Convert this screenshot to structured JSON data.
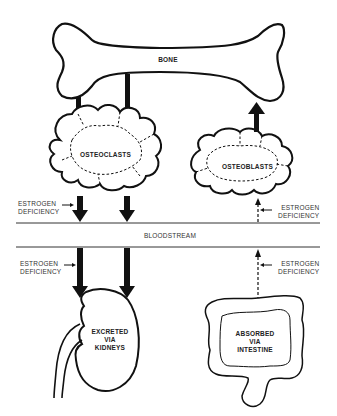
{
  "diagram": {
    "type": "osteoporosis calcium flow schematic",
    "nodes": {
      "bone": "BONE",
      "osteoclasts": "OSTEOCLASTS",
      "osteoblasts": "OSTEOBLASTS",
      "bloodstream": "BLOODSTREAM",
      "kidneys": [
        "EXCRETED",
        "VIA",
        "KIDNEYS"
      ],
      "intestine": [
        "ABSORBED",
        "VIA",
        "INTESTINE"
      ]
    },
    "annotations": {
      "estrogen_deficiency_left_upper": [
        "ESTROGEN",
        "DEFICIENCY"
      ],
      "estrogen_deficiency_right_upper": [
        "ESTROGEN",
        "DEFICIENCY"
      ],
      "estrogen_deficiency_left_lower": [
        "ESTROGEN",
        "DEFICIENCY"
      ],
      "estrogen_deficiency_right_lower": [
        "ESTROGEN",
        "DEFICIENCY"
      ]
    },
    "edges": [
      {
        "from": "BONE",
        "to": "OSTEOCLASTS",
        "style": "thick solid",
        "count": 2
      },
      {
        "from": "OSTEOCLASTS",
        "to": "BLOODSTREAM",
        "style": "thick solid arrow (increased)",
        "count": 2
      },
      {
        "from": "BLOODSTREAM",
        "to": "KIDNEYS",
        "style": "thick solid arrow (increased)",
        "count": 2
      },
      {
        "from": "OSTEOBLASTS",
        "to": "BONE",
        "style": "thick solid arrow"
      },
      {
        "from": "BLOODSTREAM",
        "to": "OSTEOBLASTS",
        "style": "dashed thin arrow (decreased)"
      },
      {
        "from": "INTESTINE",
        "to": "BLOODSTREAM",
        "style": "dashed thin arrow (decreased)"
      }
    ]
  }
}
